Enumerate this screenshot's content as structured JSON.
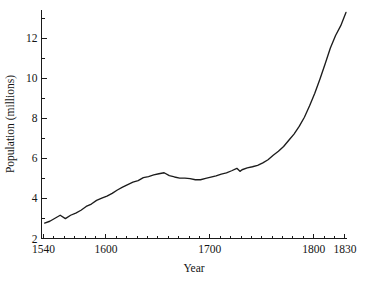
{
  "chart_data": {
    "type": "line",
    "title": "",
    "xlabel": "Year",
    "ylabel": "Population (millions)",
    "xlim": [
      1538,
      1832
    ],
    "ylim": [
      2,
      13.4
    ],
    "grid": false,
    "legend": null,
    "x_ticks_major": [
      1540,
      1600,
      1700,
      1800,
      1830
    ],
    "x_tick_labels": [
      "1540",
      "1600",
      "1700",
      "1800",
      "1830"
    ],
    "x_minor_step": 10,
    "y_ticks_major": [
      2,
      4,
      6,
      8,
      10,
      12
    ],
    "y_tick_labels": [
      "2",
      "4",
      "6",
      "8",
      "10",
      "12"
    ],
    "y_minor_step": 1,
    "line_color": "#1c1c1c",
    "background_color": "#ffffff",
    "series": [
      {
        "name": "England population",
        "x": [
          1541,
          1546,
          1551,
          1556,
          1561,
          1566,
          1571,
          1576,
          1581,
          1586,
          1591,
          1596,
          1601,
          1606,
          1611,
          1616,
          1621,
          1626,
          1631,
          1636,
          1641,
          1646,
          1651,
          1656,
          1661,
          1666,
          1671,
          1676,
          1681,
          1686,
          1691,
          1696,
          1701,
          1706,
          1711,
          1716,
          1721,
          1726,
          1729,
          1731,
          1736,
          1741,
          1746,
          1751,
          1756,
          1761,
          1766,
          1771,
          1776,
          1781,
          1786,
          1791,
          1796,
          1801,
          1806,
          1811,
          1816,
          1821,
          1826,
          1831
        ],
        "values": [
          2.77,
          2.86,
          3.01,
          3.16,
          2.99,
          3.16,
          3.27,
          3.41,
          3.6,
          3.72,
          3.9,
          4.01,
          4.11,
          4.25,
          4.42,
          4.56,
          4.69,
          4.81,
          4.89,
          5.04,
          5.09,
          5.17,
          5.23,
          5.28,
          5.14,
          5.07,
          5.01,
          5.01,
          4.99,
          4.93,
          4.93,
          5.0,
          5.06,
          5.12,
          5.21,
          5.27,
          5.38,
          5.5,
          5.35,
          5.43,
          5.52,
          5.58,
          5.65,
          5.77,
          5.93,
          6.15,
          6.35,
          6.59,
          6.9,
          7.21,
          7.59,
          8.05,
          8.62,
          9.25,
          9.96,
          10.72,
          11.5,
          12.13,
          12.62,
          13.28
        ]
      }
    ]
  },
  "axis": {
    "y_label": "Population (millions)",
    "x_label": "Year"
  }
}
